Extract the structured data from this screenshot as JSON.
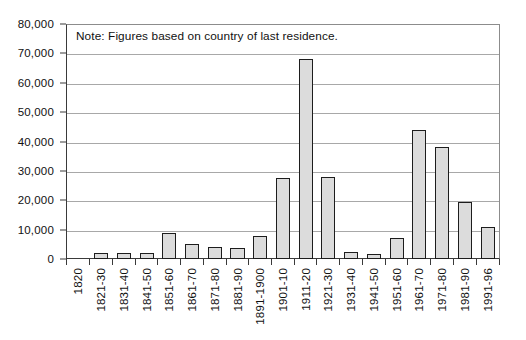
{
  "chart_data": {
    "type": "bar",
    "title": "",
    "subtitle": "",
    "xlabel": "",
    "ylabel": "",
    "ylim": [
      0,
      80000
    ],
    "yticks": [
      0,
      10000,
      20000,
      30000,
      40000,
      50000,
      60000,
      70000,
      80000
    ],
    "ytick_labels": [
      "0",
      "10,000",
      "20,000",
      "30,000",
      "40,000",
      "50,000",
      "60,000",
      "70,000",
      "80,000"
    ],
    "grid": true,
    "legend": null,
    "annotation": "Note: Figures based on country of last residence.",
    "categories": [
      "1820",
      "1821-30",
      "1831-40",
      "1841-50",
      "1851-60",
      "1861-70",
      "1871-80",
      "1881-90",
      "1891-1900",
      "1901-10",
      "1911-20",
      "1921-30",
      "1931-40",
      "1941-50",
      "1951-60",
      "1961-70",
      "1971-80",
      "1981-90",
      "1991-96"
    ],
    "values": [
      0,
      2200,
      2100,
      2000,
      8800,
      5000,
      4200,
      3700,
      7800,
      27500,
      68000,
      28000,
      2500,
      1800,
      7000,
      44000,
      38000,
      19500,
      11000
    ],
    "colors": {
      "bar_fill": "#dcdcdc",
      "bar_stroke": "#1d1d1d",
      "gridline": "#a8a8a8",
      "axis": "#3a3a3a",
      "text": "#111111",
      "background": "#ffffff"
    }
  }
}
